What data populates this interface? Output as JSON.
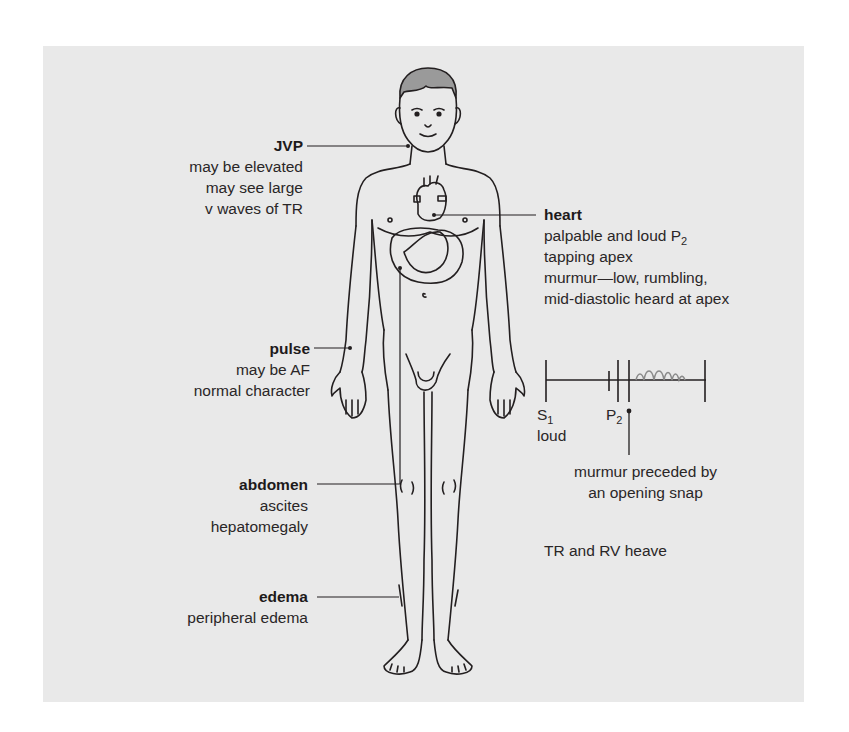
{
  "diagram": {
    "background_color": "#e9e9e9",
    "line_color": "#231f20",
    "callouts": {
      "jvp": {
        "title": "JVP",
        "lines": [
          "may be elevated",
          "may see large",
          "v waves of TR"
        ]
      },
      "heart": {
        "title": "heart",
        "lines": [
          "palpable and loud P",
          "tapping apex",
          "murmur—low, rumbling,",
          "mid-diastolic heard at apex"
        ],
        "line1_subscript": "2"
      },
      "pulse": {
        "title": "pulse",
        "lines": [
          "may be AF",
          "normal character"
        ]
      },
      "abdomen": {
        "title": "abdomen",
        "lines": [
          "ascites",
          "hepatomegaly"
        ]
      },
      "edema": {
        "title": "edema",
        "lines": [
          "peripheral edema"
        ]
      }
    },
    "heart_sounds": {
      "s1_label": "S",
      "s1_sub": "1",
      "s1_note": "loud",
      "p2_label": "P",
      "p2_sub": "2",
      "os_note_lines": [
        "murmur preceded by",
        "an opening snap"
      ]
    },
    "extra_note": "TR and RV heave"
  }
}
